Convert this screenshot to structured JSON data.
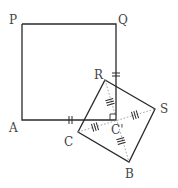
{
  "diagram": {
    "type": "geometry",
    "labels": {
      "P": "P",
      "Q": "Q",
      "A": "A",
      "R": "R",
      "S": "S",
      "B": "B",
      "C": "C",
      "C_prime": "C'"
    },
    "points": {
      "P": [
        22,
        24
      ],
      "Q": [
        116,
        24
      ],
      "A": [
        22,
        120
      ],
      "corner": [
        116,
        120
      ],
      "R": [
        105,
        80
      ],
      "S": [
        155,
        109
      ],
      "B": [
        129,
        162
      ],
      "C": [
        78,
        132
      ],
      "C_prime": [
        116,
        121
      ]
    },
    "marks": {
      "equal_double": [
        "segment Q-corner near R",
        "segment A-corner near C"
      ],
      "equal_triple": [
        "C'R",
        "C'S",
        "C'B",
        "C'C"
      ],
      "right_angle": "at corner of square (116,120)"
    }
  }
}
